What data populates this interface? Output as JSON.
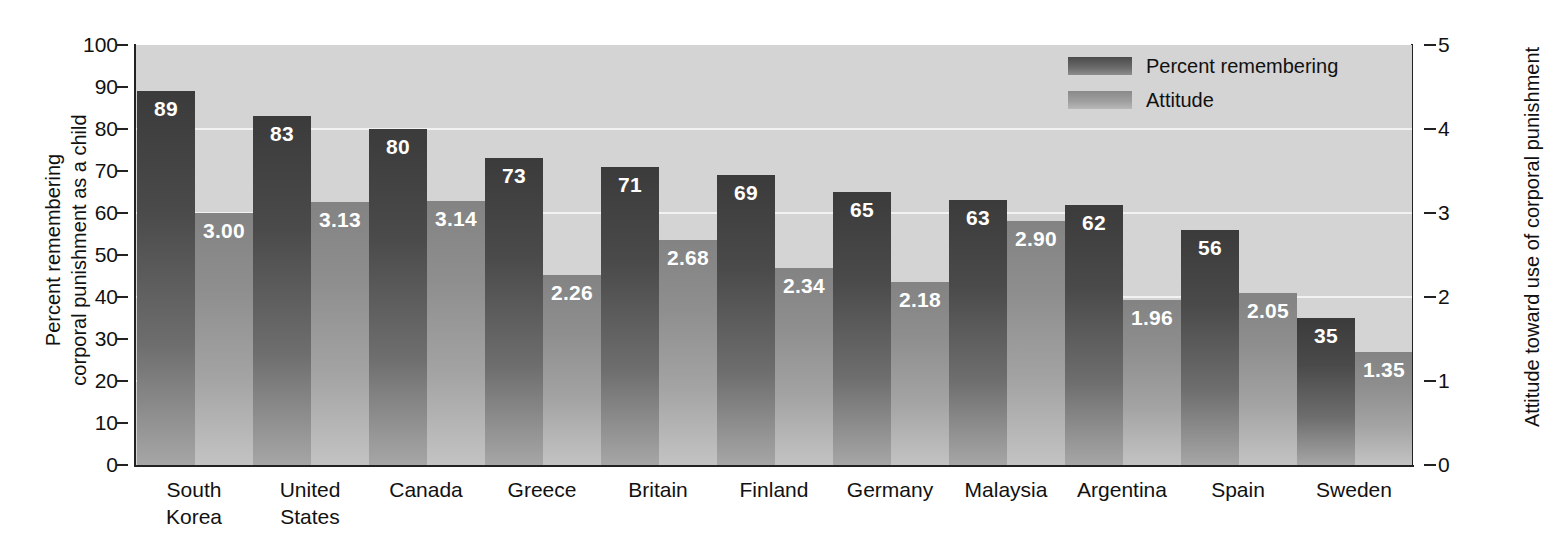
{
  "chart_data": {
    "type": "bar",
    "title": "",
    "categories": [
      "South Korea",
      "United States",
      "Canada",
      "Greece",
      "Britain",
      "Finland",
      "Germany",
      "Malaysia",
      "Argentina",
      "Spain",
      "Sweden"
    ],
    "series": [
      {
        "name": "Percent remembering",
        "axis": "left",
        "values": [
          89,
          83,
          80,
          73,
          71,
          69,
          65,
          63,
          62,
          56,
          35
        ],
        "labels": [
          "89",
          "83",
          "80",
          "73",
          "71",
          "69",
          "65",
          "63",
          "62",
          "56",
          "35"
        ],
        "color": "#4a4a4a"
      },
      {
        "name": "Attitude",
        "axis": "right",
        "values": [
          3.0,
          3.13,
          3.14,
          2.26,
          2.68,
          2.34,
          2.18,
          2.9,
          1.96,
          2.05,
          1.35
        ],
        "labels": [
          "3.00",
          "3.13",
          "3.14",
          "2.26",
          "2.68",
          "2.34",
          "2.18",
          "2.90",
          "1.96",
          "2.05",
          "1.35"
        ],
        "color": "#9a9a9a"
      }
    ],
    "xlabel": "",
    "ylabel": "Percent remembering corporal punishment as a child",
    "ylabel_right": "Attitude toward use of corporal punishment",
    "ylim": [
      0,
      100
    ],
    "ylim_right": [
      0,
      5
    ],
    "yticks_left": [
      "0",
      "10",
      "20",
      "30",
      "40",
      "50",
      "60",
      "70",
      "80",
      "90",
      "100"
    ],
    "yticks_right": [
      "0",
      "1",
      "2",
      "3",
      "4",
      "5"
    ],
    "gridlines": [
      20,
      40,
      60,
      80
    ],
    "grid": true,
    "legend_position": "top-right",
    "plot_background": "#d4d4d4"
  },
  "axes": {
    "left_title": "Percent remembering\ncorporal punishment as a child",
    "right_title": "Attitude toward use of corporal punishment"
  },
  "legend": {
    "items": [
      {
        "label": "Percent remembering",
        "swatch": "dark-gray-swatch"
      },
      {
        "label": "Attitude",
        "swatch": "light-gray-swatch"
      }
    ]
  }
}
